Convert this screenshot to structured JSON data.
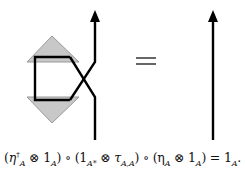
{
  "diagram": {
    "left_side": {
      "name": "cup-cap-with-braiding",
      "upper_triangle": "eta_A (unit)",
      "lower_triangle": "eta_A dagger (counit)",
      "fill": "#c8c8c8"
    },
    "equals": "=",
    "right_side": {
      "name": "identity-strand"
    },
    "stroke_color": "#000000"
  },
  "caption": {
    "p1": "(",
    "eta_dag": "η",
    "eta_dag_sup": "†",
    "eta_dag_sub": "A",
    "otimes1": " ⊗ 1",
    "sub_A1": "A",
    "p1c": ") ∘ (1",
    "sub_Astar": "A*",
    "otimes2": " ⊗ τ",
    "sub_AA": "A,A",
    "p2c": ") ∘ (η",
    "sub_A2": "A",
    "otimes3": " ⊗ 1",
    "sub_A3": "A",
    "p3c": ") = 1",
    "sub_A4": "A",
    "end": "."
  }
}
